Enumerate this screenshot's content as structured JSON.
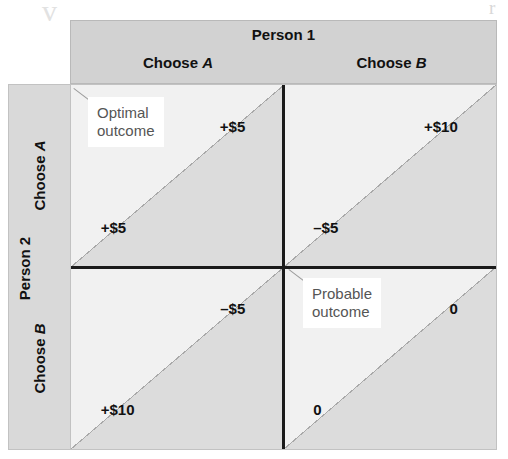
{
  "figure": {
    "type": "payoff-matrix",
    "artifacts": {
      "left_mark": "v",
      "right_mark": "r"
    }
  },
  "column_header": {
    "title": "Person 1",
    "columns": [
      {
        "prefix": "Choose ",
        "choice": "A"
      },
      {
        "prefix": "Choose ",
        "choice": "B"
      }
    ]
  },
  "row_header": {
    "title": "Person 2",
    "rows": [
      {
        "prefix": "Choose ",
        "choice": "A"
      },
      {
        "prefix": "Choose ",
        "choice": "B"
      }
    ]
  },
  "cells": [
    {
      "id": "A-A",
      "row": "Choose A",
      "column": "Choose A",
      "person1_payoff": "+$5",
      "person2_payoff": "+$5",
      "callout": "Optimal\noutcome"
    },
    {
      "id": "A-B",
      "row": "Choose A",
      "column": "Choose B",
      "person1_payoff": "+$10",
      "person2_payoff": "–$5",
      "callout": ""
    },
    {
      "id": "B-A",
      "row": "Choose B",
      "column": "Choose A",
      "person1_payoff": "–$5",
      "person2_payoff": "+$10",
      "callout": ""
    },
    {
      "id": "B-B",
      "row": "Choose B",
      "column": "Choose B",
      "person1_payoff": "0",
      "person2_payoff": "0",
      "callout": "Probable\noutcome"
    }
  ],
  "colors": {
    "header_band": "#d2d2d2",
    "row_band": "#d9d9d9",
    "triangle_upper": "#dcdcdc",
    "triangle_lower": "#f1f1f1",
    "divider": "#1a1a1a",
    "text": "#111111",
    "callout_text": "#555555"
  }
}
